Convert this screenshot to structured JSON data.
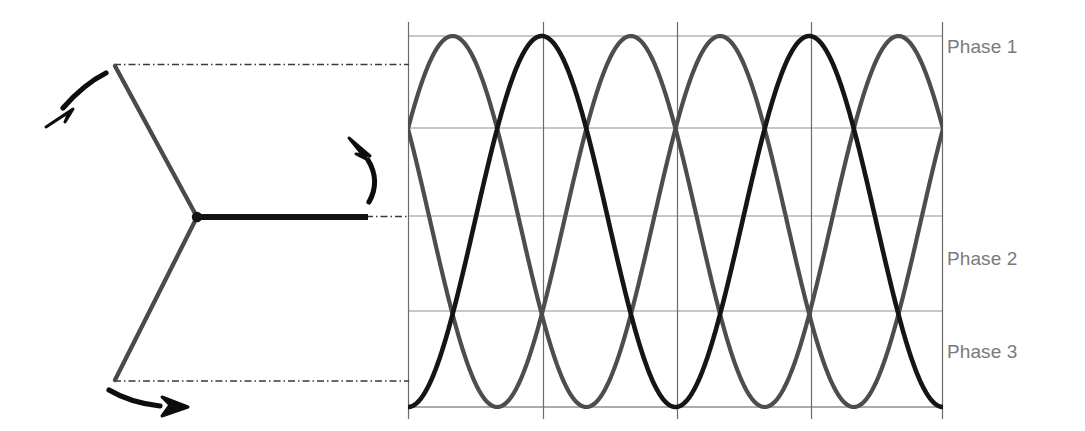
{
  "figure": {
    "background_color": "#ffffff",
    "labels": [
      {
        "id": "phase1",
        "text": "Phase 1",
        "color": "#7a7a7a"
      },
      {
        "id": "phase2",
        "text": "Phase 2",
        "color": "#7a7a7a"
      },
      {
        "id": "phase3",
        "text": "Phase 3",
        "color": "#7a7a7a"
      }
    ],
    "vector_diagram": {
      "name": "three-phase-star-vector-diagram",
      "center": {
        "x": 197,
        "y": 217
      },
      "stroke_color": "#4d4d4d",
      "emphasis_color": "#1a1a1a",
      "spokes": [
        {
          "id": "phase1-spoke",
          "angle_deg": 120,
          "tip": {
            "x": 115,
            "y": 65
          },
          "emphasized": false
        },
        {
          "id": "phase2-spoke",
          "angle_deg": 0,
          "tip": {
            "x": 368,
            "y": 217
          },
          "emphasized": true
        },
        {
          "id": "phase3-spoke",
          "angle_deg": 240,
          "tip": {
            "x": 115,
            "y": 381
          },
          "emphasized": false
        }
      ],
      "rotation_arrows": [
        {
          "id": "rotation-arrow-top-left",
          "direction": "down-left"
        },
        {
          "id": "rotation-arrow-right",
          "direction": "up"
        },
        {
          "id": "rotation-arrow-bottom-left",
          "direction": "right"
        }
      ],
      "projection_lines": [
        {
          "id": "projection-phase1",
          "from": {
            "x": 115,
            "y": 65
          },
          "to": {
            "x": 408,
            "y": 65
          },
          "style": "dash-dot"
        },
        {
          "id": "projection-phase2",
          "from": {
            "x": 368,
            "y": 217
          },
          "to": {
            "x": 408,
            "y": 217
          },
          "style": "dash-dot"
        },
        {
          "id": "projection-phase3",
          "from": {
            "x": 115,
            "y": 381
          },
          "to": {
            "x": 408,
            "y": 381
          },
          "style": "dash-dot"
        }
      ]
    }
  },
  "chart_data": {
    "type": "line",
    "title": "",
    "xlabel": "",
    "ylabel": "",
    "grid": true,
    "legend_position": "right",
    "plot_box_px": {
      "left": 408,
      "right": 943,
      "top": 36,
      "bottom": 407
    },
    "x": [
      0,
      15,
      30,
      45,
      60,
      75,
      90,
      105,
      120,
      135,
      150,
      165,
      180,
      195,
      210,
      225,
      240,
      255,
      270,
      285,
      300,
      315,
      330,
      345,
      360,
      375,
      390,
      405,
      420,
      435,
      450,
      465,
      480,
      495,
      510,
      525,
      540,
      555,
      570,
      585,
      600,
      615,
      630,
      645,
      660,
      675,
      690,
      705,
      720
    ],
    "x_unit": "degrees",
    "xlim": [
      0,
      720
    ],
    "ylim": [
      -1,
      1
    ],
    "y_gridlines": [
      1,
      0.5,
      0,
      -0.5,
      -1
    ],
    "x_gridlines": [
      0,
      180,
      360,
      540,
      720
    ],
    "series": [
      {
        "name": "Phase 1",
        "color": "#1a1a1a",
        "amplitude": 1,
        "phase_deg": -90,
        "periods": 2,
        "description": "Sine starting at minimum-ish left edge (cos shifted), peaks at first vertical gridline region"
      },
      {
        "name": "Phase 2",
        "color": "#4d4d4d",
        "amplitude": 1,
        "phase_deg": 30,
        "periods": 2,
        "description": "Sine leading, rising toward right edge crossing Phase 3"
      },
      {
        "name": "Phase 3",
        "color": "#4d4d4d",
        "amplitude": 1,
        "phase_deg": 150,
        "periods": 2,
        "description": "Sine lagging, falling toward right edge crossing Phase 2"
      }
    ],
    "legend": [
      "Phase 1",
      "Phase 2",
      "Phase 3"
    ],
    "axis_color": "#808080",
    "major_axis_color": "#4d4d4d"
  }
}
